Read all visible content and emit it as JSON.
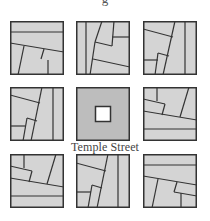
{
  "header": {
    "clipped_title": "g"
  },
  "diagram": {
    "center_label": "Temple Street",
    "colors": {
      "fill": "#d4d4d4",
      "center_fill": "#bdbdbd",
      "stroke": "#333333",
      "hole": "#ffffff"
    },
    "tiles": [
      {
        "id": "top-left",
        "x": 10,
        "y": 21,
        "lines": [
          [
            0,
            10,
            54,
            10
          ],
          [
            0,
            36,
            54,
            44
          ],
          [
            0,
            22,
            54,
            30
          ]
        ]
      },
      {
        "id": "top-center",
        "x": 76,
        "y": 21,
        "lines": [
          [
            10,
            0,
            10,
            54
          ]
        ]
      },
      {
        "id": "top-right",
        "x": 143,
        "y": 21,
        "lines": [
          [
            42,
            0,
            42,
            54
          ]
        ]
      },
      {
        "id": "middle-left",
        "x": 10,
        "y": 87,
        "lines": [
          [
            42,
            0,
            42,
            54
          ]
        ]
      },
      {
        "id": "center",
        "x": 76,
        "y": 87,
        "lines": []
      },
      {
        "id": "middle-right",
        "x": 143,
        "y": 87,
        "lines": [
          [
            0,
            42,
            54,
            42
          ]
        ]
      },
      {
        "id": "bottom-left",
        "x": 10,
        "y": 154,
        "lines": [
          [
            0,
            42,
            54,
            42
          ]
        ]
      },
      {
        "id": "bottom-center",
        "x": 76,
        "y": 154,
        "lines": [
          [
            42,
            0,
            42,
            54
          ]
        ]
      },
      {
        "id": "bottom-right",
        "x": 143,
        "y": 154,
        "lines": [
          [
            0,
            10,
            54,
            10
          ]
        ]
      }
    ]
  }
}
